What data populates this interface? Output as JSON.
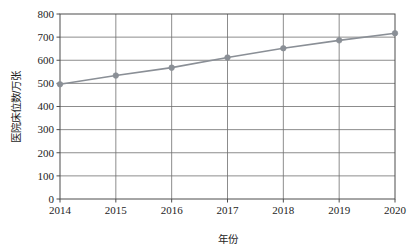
{
  "chart_data": {
    "type": "line",
    "title": "",
    "subtitle": "",
    "xlabel": "年份",
    "ylabel": "医院床位数/万张",
    "categories": [
      "2014",
      "2015",
      "2016",
      "2017",
      "2018",
      "2019",
      "2020"
    ],
    "x": [
      2014,
      2015,
      2016,
      2017,
      2018,
      2019,
      2020
    ],
    "values": [
      496,
      534,
      568,
      612,
      652,
      686,
      717
    ],
    "series": [
      {
        "name": "医院床位数",
        "values": [
          496,
          534,
          568,
          612,
          652,
          686,
          717
        ]
      }
    ],
    "xlim": [
      2014,
      2020
    ],
    "ylim": [
      0,
      800
    ],
    "ytick_labels": [
      "0",
      "100",
      "200",
      "300",
      "400",
      "500",
      "600",
      "700",
      "800"
    ],
    "ytick_values": [
      0,
      100,
      200,
      300,
      400,
      500,
      600,
      700,
      800
    ],
    "xtick_labels": [
      "2014",
      "2015",
      "2016",
      "2017",
      "2018",
      "2019",
      "2020"
    ],
    "grid": "both",
    "legend": "none",
    "marker": "circle",
    "line_color": "#8a8f96",
    "marker_color": "#8a8f96",
    "grid_color": "#6f6f6f",
    "axis_color": "#4d4d4d"
  },
  "axis": {
    "y_title": "医院床位数/万张",
    "x_title": "年份"
  }
}
